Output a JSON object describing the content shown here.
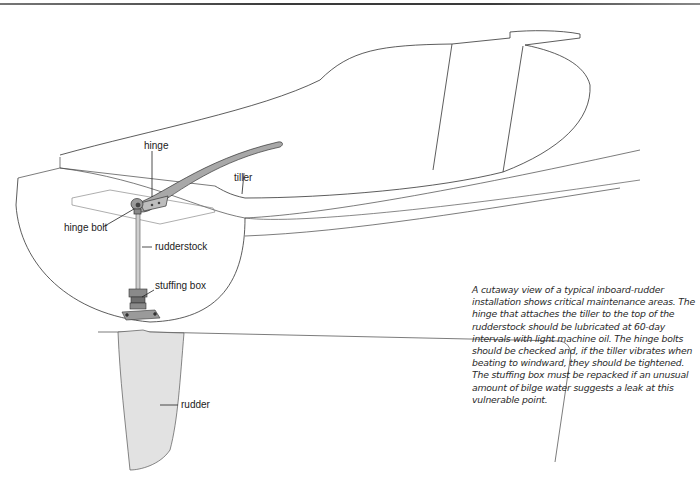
{
  "figure": {
    "type": "cutaway diagram",
    "subject": "inboard-rudder installation",
    "labels": {
      "hinge": "hinge",
      "tiller": "tiller",
      "hinge_bolt": "hinge bolt",
      "rudderstock": "rudderstock",
      "stuffing_box": "stuffing box",
      "rudder": "rudder"
    },
    "caption": "A cutaway view of a typical inboard-rudder installation shows critical maintenance areas. The hinge that attaches the tiller to the top of the rudderstock should be lubricated at 60-day intervals with light machine oil. The hinge bolts should be checked and, if the tiller vibrates when beating to windward, they should be tightened. The stuffing box must be repacked if an unusual amount of bilge water suggests a leak at this vulnerable point.",
    "colors": {
      "line": "#333333",
      "rudder_fill": "#e2e2e2",
      "metal_fill": "#9a9a9a"
    }
  }
}
